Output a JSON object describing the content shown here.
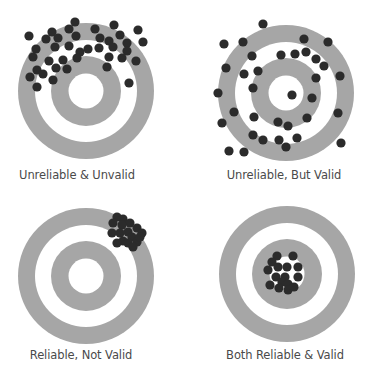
{
  "colors": {
    "ring": "#a6a6a6",
    "background": "#ffffff",
    "dot": "#2b2b2b",
    "label": "#4a4a4a"
  },
  "ring_radii": [
    68,
    51,
    35,
    17.5
  ],
  "dot_radius": 4.6,
  "targets": [
    {
      "label": "Unreliable & Unvalid",
      "center": [
        86,
        91
      ],
      "label_pos": [
        77,
        176
      ],
      "dots": [
        [
          29,
          36
        ],
        [
          75,
          22
        ],
        [
          52,
          32
        ],
        [
          69,
          29
        ],
        [
          95,
          29
        ],
        [
          114,
          25
        ],
        [
          138,
          30
        ],
        [
          46,
          39
        ],
        [
          58,
          38
        ],
        [
          76,
          36
        ],
        [
          100,
          38
        ],
        [
          120,
          35
        ],
        [
          109,
          41
        ],
        [
          127,
          43
        ],
        [
          143,
          42
        ],
        [
          36,
          49
        ],
        [
          55,
          47
        ],
        [
          69,
          46
        ],
        [
          80,
          52
        ],
        [
          88,
          49
        ],
        [
          99,
          48
        ],
        [
          113,
          47
        ],
        [
          127,
          51
        ],
        [
          33,
          57
        ],
        [
          49,
          61
        ],
        [
          63,
          60
        ],
        [
          77,
          58
        ],
        [
          109,
          57
        ],
        [
          122,
          58
        ],
        [
          136,
          61
        ],
        [
          37,
          70
        ],
        [
          56,
          68
        ],
        [
          67,
          69
        ],
        [
          43,
          74
        ],
        [
          107,
          67
        ],
        [
          30,
          77
        ],
        [
          53,
          80
        ],
        [
          37,
          87
        ],
        [
          129,
          83
        ]
      ]
    },
    {
      "label": "Unreliable, But Valid",
      "center": [
        286,
        93
      ],
      "label_pos": [
        284,
        176
      ],
      "dots": [
        [
          263,
          24
        ],
        [
          224,
          44
        ],
        [
          243,
          42
        ],
        [
          304,
          39
        ],
        [
          328,
          42
        ],
        [
          252,
          56
        ],
        [
          281,
          55
        ],
        [
          295,
          54
        ],
        [
          306,
          52
        ],
        [
          316,
          59
        ],
        [
          324,
          66
        ],
        [
          226,
          68
        ],
        [
          244,
          74
        ],
        [
          258,
          71
        ],
        [
          316,
          78
        ],
        [
          340,
          76
        ],
        [
          218,
          93
        ],
        [
          253,
          88
        ],
        [
          292,
          95
        ],
        [
          312,
          98
        ],
        [
          234,
          112
        ],
        [
          338,
          113
        ],
        [
          222,
          123
        ],
        [
          254,
          117
        ],
        [
          278,
          122
        ],
        [
          288,
          126
        ],
        [
          307,
          118
        ],
        [
          253,
          135
        ],
        [
          263,
          140
        ],
        [
          279,
          140
        ],
        [
          297,
          138
        ],
        [
          286,
          147
        ],
        [
          229,
          151
        ],
        [
          244,
          152
        ],
        [
          341,
          143
        ]
      ]
    },
    {
      "label": "Reliable, Not Valid",
      "center": [
        86,
        276
      ],
      "label_pos": [
        81,
        356
      ],
      "dots": [
        [
          117,
          217
        ],
        [
          123,
          219
        ],
        [
          130,
          223
        ],
        [
          113,
          223
        ],
        [
          122,
          225
        ],
        [
          137,
          228
        ],
        [
          142,
          233
        ],
        [
          112,
          233
        ],
        [
          120,
          233
        ],
        [
          128,
          232
        ],
        [
          132,
          237
        ],
        [
          123,
          241
        ],
        [
          117,
          243
        ],
        [
          128,
          243
        ],
        [
          137,
          242
        ],
        [
          133,
          247
        ],
        [
          140,
          237
        ]
      ]
    },
    {
      "label": "Both Reliable & Valid",
      "center": [
        287,
        274
      ],
      "label_pos": [
        285,
        356
      ],
      "dots": [
        [
          277,
          256
        ],
        [
          293,
          256
        ],
        [
          272,
          262
        ],
        [
          278,
          267
        ],
        [
          287,
          267
        ],
        [
          298,
          267
        ],
        [
          268,
          270
        ],
        [
          276,
          277
        ],
        [
          285,
          277
        ],
        [
          298,
          277
        ],
        [
          282,
          282
        ],
        [
          270,
          285
        ],
        [
          279,
          288
        ],
        [
          288,
          284
        ],
        [
          288,
          290
        ],
        [
          294,
          287
        ]
      ]
    }
  ]
}
